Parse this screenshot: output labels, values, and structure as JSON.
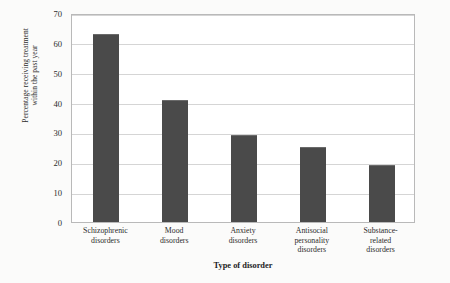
{
  "chart_data": {
    "type": "bar",
    "title": "",
    "xlabel": "Type of disorder",
    "ylabel": "Percentage receiving treatment within the past year",
    "ylabel_line1": "Percentage receiving treatment",
    "ylabel_line2": "within the past year",
    "categories": [
      "Schizophrenic disorders",
      "Mood disorders",
      "Anxiety disorders",
      "Antisocial personality disorders",
      "Substance-related disorders"
    ],
    "category_lines": [
      [
        "Schizophrenic",
        "disorders"
      ],
      [
        "Mood",
        "disorders"
      ],
      [
        "Anxiety",
        "disorders"
      ],
      [
        "Antisocial",
        "personality",
        "disorders"
      ],
      [
        "Substance-",
        "related",
        "disorders"
      ]
    ],
    "values": [
      63,
      41,
      29,
      25,
      19
    ],
    "ylim": [
      0,
      70
    ],
    "ytick_step": 10,
    "yticks": [
      "0",
      "10",
      "20",
      "30",
      "40",
      "50",
      "60",
      "70"
    ],
    "grid": true,
    "legend": false,
    "bar_color": "#4a4a4a",
    "grid_color": "#d5d5d5",
    "axis_color": "#b9b9b9",
    "background": "#ffffff"
  }
}
